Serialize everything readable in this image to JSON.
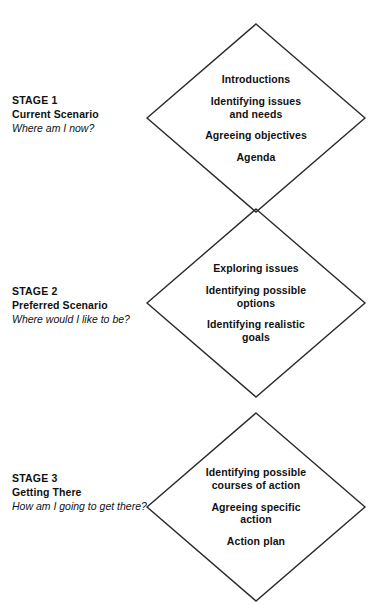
{
  "diagram": {
    "stroke_color": "#2b2b2b",
    "text_color": "#111111",
    "background": "#ffffff"
  },
  "stages": [
    {
      "number": "STAGE 1",
      "name": "Current Scenario",
      "question": "Where am I now?",
      "center_y": 118,
      "items": [
        "Introductions",
        "Identifying issues\nand needs",
        "Agreeing objectives",
        "Agenda"
      ]
    },
    {
      "number": "STAGE 2",
      "name": "Preferred Scenario",
      "question": "Where would I like to be?",
      "center_y": 303,
      "items": [
        "Exploring issues",
        "Identifying possible\noptions",
        "Identifying realistic\ngoals"
      ]
    },
    {
      "number": "STAGE 3",
      "name": "Getting There",
      "question": "How am I going to get there?",
      "center_y": 507,
      "items": [
        "Identifying possible\ncourses of action",
        "Agreeing specific\naction",
        "Action plan"
      ]
    }
  ],
  "geometry": {
    "center_x": 256,
    "half_width": 109,
    "half_height": 94
  }
}
